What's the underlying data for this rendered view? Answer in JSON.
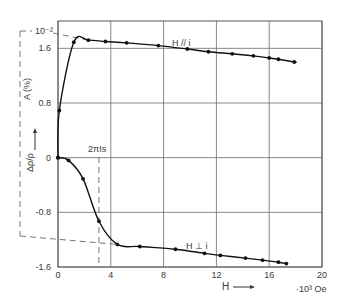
{
  "chart_data": {
    "type": "line",
    "title": "",
    "xlabel": "H",
    "x_unit": "·10³ Oe",
    "ylabel_upper": "A (%)",
    "ylabel_lower": "Δρ/ρ",
    "scale_note": "10⁻²",
    "annotation": "2πIs",
    "xlim": [
      0,
      20
    ],
    "ylim": [
      -1.6,
      2.0
    ],
    "x_ticks": [
      "0",
      "4",
      "8",
      "12",
      "16",
      "20"
    ],
    "y_ticks": [
      "1.6",
      "0.8",
      "0",
      "-0.8",
      "-1.6"
    ],
    "grid": true,
    "series": [
      {
        "name": "H // i",
        "x": [
          0,
          0.1,
          1.2,
          2.3,
          3.6,
          5.2,
          7.6,
          9.8,
          11.4,
          13.2,
          14.8,
          16.0,
          16.7,
          17.9
        ],
        "y": [
          0,
          0.69,
          1.69,
          1.72,
          1.7,
          1.68,
          1.64,
          1.59,
          1.55,
          1.52,
          1.49,
          1.46,
          1.44,
          1.4
        ]
      },
      {
        "name": "H ⊥ i",
        "x": [
          0,
          0.8,
          1.9,
          3.1,
          4.5,
          6.2,
          8.9,
          11.1,
          12.3,
          14.2,
          15.5,
          16.7,
          17.3
        ],
        "y": [
          0,
          -0.04,
          -0.31,
          -0.93,
          -1.27,
          -1.3,
          -1.34,
          -1.4,
          -1.43,
          -1.47,
          -1.5,
          -1.53,
          -1.55
        ]
      }
    ],
    "saturation_marker_x": 3.1
  }
}
